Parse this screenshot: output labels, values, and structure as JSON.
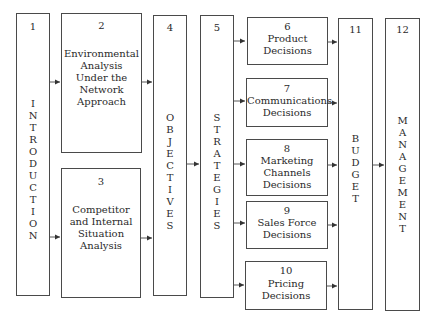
{
  "diagram": {
    "type": "flowchart",
    "boxes": [
      {
        "id": "1",
        "number": "1",
        "label": "INTRODUCTION",
        "orientation": "vertical"
      },
      {
        "id": "2",
        "number": "2",
        "label": "Environmental Analysis Under the Network Approach",
        "orientation": "horizontal"
      },
      {
        "id": "3",
        "number": "3",
        "label": "Competitor and Internal Situation Analysis",
        "orientation": "horizontal"
      },
      {
        "id": "4",
        "number": "4",
        "label": "OBJECTIVES",
        "orientation": "vertical"
      },
      {
        "id": "5",
        "number": "5",
        "label": "STRATEGIES",
        "orientation": "vertical"
      },
      {
        "id": "6",
        "number": "6",
        "label": "Product Decisions",
        "orientation": "horizontal"
      },
      {
        "id": "7",
        "number": "7",
        "label": "Communications Decisions",
        "orientation": "horizontal"
      },
      {
        "id": "8",
        "number": "8",
        "label": "Marketing Channels Decisions",
        "orientation": "horizontal"
      },
      {
        "id": "9",
        "number": "9",
        "label": "Sales Force Decisions",
        "orientation": "horizontal"
      },
      {
        "id": "10",
        "number": "10",
        "label": "Pricing Decisions",
        "orientation": "horizontal"
      },
      {
        "id": "11",
        "number": "11",
        "label": "BUDGET",
        "orientation": "vertical"
      },
      {
        "id": "12",
        "number": "12",
        "label": "MANAGEMENT",
        "orientation": "vertical"
      }
    ],
    "edges": [
      [
        "1",
        "2"
      ],
      [
        "1",
        "3"
      ],
      [
        "2",
        "4"
      ],
      [
        "3",
        "4"
      ],
      [
        "4",
        "5"
      ],
      [
        "5",
        "6"
      ],
      [
        "5",
        "7"
      ],
      [
        "5",
        "8"
      ],
      [
        "5",
        "9"
      ],
      [
        "5",
        "10"
      ],
      [
        "6",
        "11"
      ],
      [
        "7",
        "11"
      ],
      [
        "8",
        "11"
      ],
      [
        "9",
        "11"
      ],
      [
        "10",
        "11"
      ],
      [
        "11",
        "12"
      ]
    ],
    "text": {
      "b1_num": "1",
      "b1_vert": "I\nN\nT\nR\nO\nD\nU\nC\nT\nI\nO\nN",
      "b2_num": "2",
      "b2_l1": "Environmental",
      "b2_l2": "Analysis",
      "b2_l3": "Under the",
      "b2_l4": "Network",
      "b2_l5": "Approach",
      "b3_num": "3",
      "b3_l1": "Competitor",
      "b3_l2": "and Internal",
      "b3_l3": "Situation",
      "b3_l4": "Analysis",
      "b4_num": "4",
      "b4_vert": "O\nB\nJ\nE\nC\nT\nI\nV\nE\nS",
      "b5_num": "5",
      "b5_vert": "S\nT\nR\nA\nT\nE\nG\nI\nE\nS",
      "b6_num": "6",
      "b6_l1": "Product",
      "b6_l2": "Decisions",
      "b7_num": "7",
      "b7_l1": "Communications",
      "b7_l2": "Decisions",
      "b8_num": "8",
      "b8_l1": "Marketing",
      "b8_l2": "Channels",
      "b8_l3": "Decisions",
      "b9_num": "9",
      "b9_l1": "Sales Force",
      "b9_l2": "Decisions",
      "b10_num": "10",
      "b10_l1": "Pricing",
      "b10_l2": "Decisions",
      "b11_num": "11",
      "b11_vert": "B\nU\nD\nG\nE\nT",
      "b12_num": "12",
      "b12_vert": "M\nA\nN\nA\nG\nE\nM\nE\nN\nT"
    }
  }
}
